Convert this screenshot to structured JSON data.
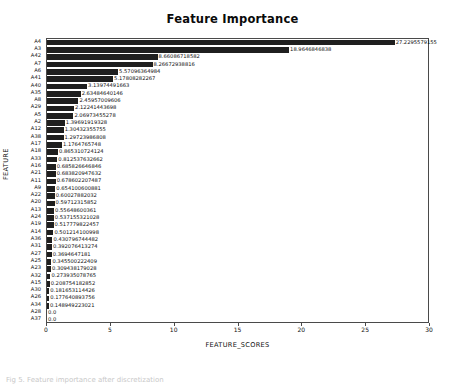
{
  "figure": {
    "title": "Feature Importance",
    "caption": "Fig 5. Feature importance after discretization"
  },
  "axes": {
    "xlabel": "FEATURE_SCORES",
    "ylabel": "FEATURE",
    "xticks": [
      0,
      5,
      10,
      15,
      20,
      25,
      30
    ]
  },
  "chart_data": {
    "type": "bar",
    "orientation": "horizontal",
    "title": "Feature Importance",
    "xlabel": "FEATURE_SCORES",
    "ylabel": "FEATURE",
    "xlim": [
      0,
      30
    ],
    "grid": false,
    "legend": null,
    "bar_color": "#1f1f1f",
    "categories": [
      "A4",
      "A3",
      "A42",
      "A7",
      "A6",
      "A41",
      "A40",
      "A35",
      "A8",
      "A29",
      "A5",
      "A2",
      "A12",
      "A38",
      "A17",
      "A18",
      "A33",
      "A16",
      "A21",
      "A11",
      "A9",
      "A22",
      "A20",
      "A13",
      "A24",
      "A19",
      "A14",
      "A36",
      "A31",
      "A27",
      "A25",
      "A23",
      "A32",
      "A15",
      "A30",
      "A26",
      "A34",
      "A28",
      "A37"
    ],
    "values": [
      27.2295579155,
      18.9646846838,
      8.66086718582,
      8.26672938816,
      5.57096364984,
      5.17808282267,
      3.13974491663,
      2.63484640146,
      2.45957009606,
      2.12241443698,
      2.06973455278,
      1.39691919328,
      1.30432355755,
      1.29723986808,
      1.1764765748,
      0.865310724124,
      0.812537632662,
      0.685826646846,
      0.683820947632,
      0.678602207487,
      0.654100600881,
      0.60027882032,
      0.59712315852,
      0.55648600361,
      0.537155321028,
      0.517779822457,
      0.501214100998,
      0.430796744482,
      0.392076413274,
      0.3694647181,
      0.345500222409,
      0.309438179028,
      0.273935078765,
      0.208754182852,
      0.181653114426,
      0.177640893756,
      0.148949223021,
      0.0,
      0.0
    ],
    "value_labels": [
      "27.2295579155",
      "18.9646846838",
      "8.66086718582",
      "8.26672938816",
      "5.57096364984",
      "5.17808282267",
      "3.13974491663",
      "2.63484640146",
      "2.45957009606",
      "2.12241443698",
      "2.06973455278",
      "1.39691919328",
      "1.30432355755",
      "1.29723986808",
      "1.1764765748",
      "0.865310724124",
      "0.812537632662",
      "0.685826646846",
      "0.683820947632",
      "0.678602207487",
      "0.654100600881",
      "0.60027882032",
      "0.59712315852",
      "0.55648600361",
      "0.537155321028",
      "0.517779822457",
      "0.501214100998",
      "0.430796744482",
      "0.392076413274",
      "0.3694647181",
      "0.345500222409",
      "0.309438179028",
      "0.273935078765",
      "0.208754182852",
      "0.181653114426",
      "0.177640893756",
      "0.148949223021",
      "0.0",
      "0.0"
    ]
  }
}
